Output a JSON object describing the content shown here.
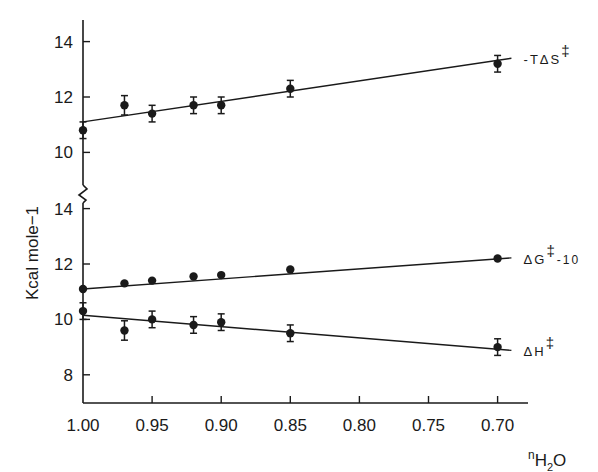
{
  "chart_data": {
    "type": "scatter",
    "title": "",
    "xlabel": "nH2O",
    "xlabel_parts": {
      "prefix": "n",
      "main": "H",
      "sub": "2",
      "suffix": "O"
    },
    "ylabel": "Kcal mole−1",
    "xlim": [
      1.0,
      0.68
    ],
    "x_reversed": true,
    "x_ticks": [
      1.0,
      0.95,
      0.9,
      0.85,
      0.8,
      0.75,
      0.7
    ],
    "x_tick_labels": [
      "1.00",
      "0.95",
      "0.90",
      "0.85",
      "0.80",
      "0.75",
      "0.70"
    ],
    "broken_y_axis": true,
    "panels": [
      {
        "name": "upper",
        "ylim": [
          10,
          15
        ],
        "y_ticks": [
          10,
          12,
          14
        ],
        "y_tick_labels": [
          "10",
          "12",
          "14"
        ]
      },
      {
        "name": "lower",
        "ylim": [
          7,
          14
        ],
        "y_ticks": [
          8,
          10,
          12,
          14
        ],
        "y_tick_labels": [
          "8",
          "10",
          "12",
          "14"
        ]
      }
    ],
    "grid": false,
    "legend": "inline labels at right end of each line",
    "series": [
      {
        "name": "-TΔS‡",
        "label": "-TΔS",
        "label_sup": "‡",
        "panel": "upper",
        "x": [
          1.0,
          0.97,
          0.95,
          0.92,
          0.9,
          0.85,
          0.7
        ],
        "values": [
          10.8,
          11.7,
          11.4,
          11.7,
          11.7,
          12.3,
          13.2
        ],
        "errors": [
          0.3,
          0.35,
          0.3,
          0.3,
          0.3,
          0.3,
          0.3
        ],
        "fit_line": {
          "x": [
            1.0,
            0.69
          ],
          "y": [
            11.1,
            13.4
          ]
        }
      },
      {
        "name": "ΔG‡-10",
        "label": "ΔG",
        "label_sup": "‡",
        "label_sub": "-10",
        "panel": "lower",
        "x": [
          1.0,
          0.97,
          0.95,
          0.92,
          0.9,
          0.85,
          0.7
        ],
        "values": [
          11.1,
          11.3,
          11.4,
          11.55,
          11.6,
          11.8,
          12.2
        ],
        "errors": [
          0,
          0,
          0,
          0,
          0,
          0,
          0
        ],
        "fit_line": {
          "x": [
            1.0,
            0.69
          ],
          "y": [
            11.1,
            12.22
          ]
        }
      },
      {
        "name": "ΔH‡",
        "label": "ΔH",
        "label_sup": "‡",
        "panel": "lower",
        "x": [
          1.0,
          0.97,
          0.95,
          0.92,
          0.9,
          0.85,
          0.7
        ],
        "values": [
          10.3,
          9.6,
          10.0,
          9.8,
          9.9,
          9.5,
          9.0
        ],
        "errors": [
          0.3,
          0.35,
          0.3,
          0.3,
          0.3,
          0.3,
          0.3
        ],
        "fit_line": {
          "x": [
            1.0,
            0.69
          ],
          "y": [
            10.15,
            8.88
          ]
        }
      }
    ]
  }
}
